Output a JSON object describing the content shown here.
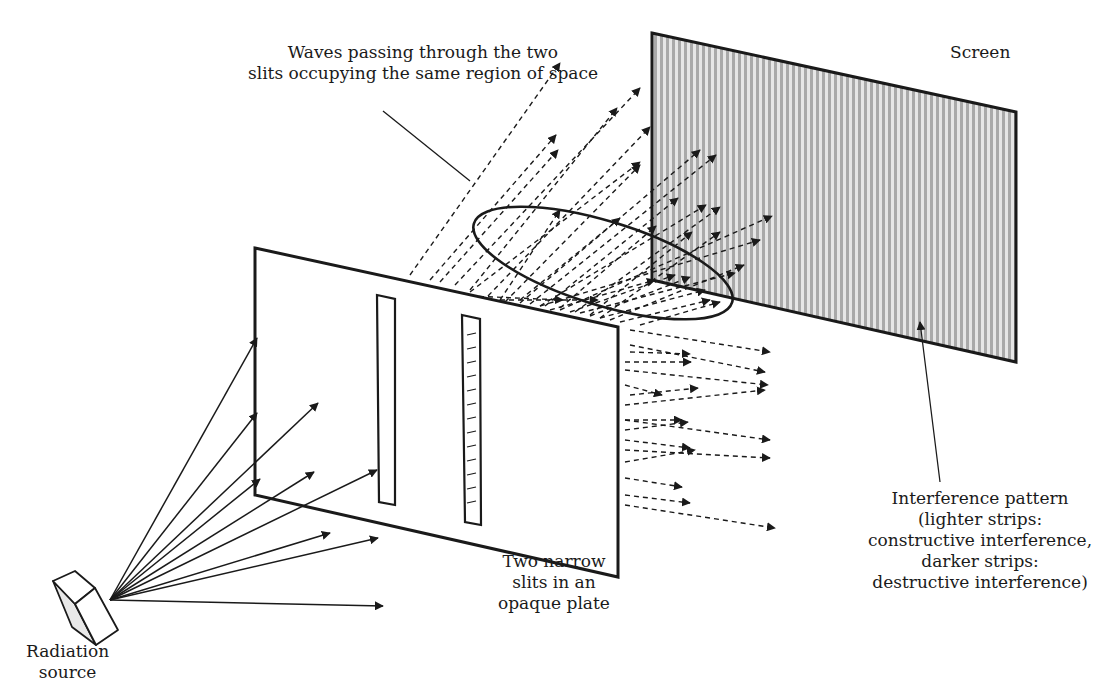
{
  "diagram": {
    "colors": {
      "ink": "#1a1a1a",
      "screen_fill": "#bdbdbd",
      "screen_stripe_light": "#e6e6e6",
      "plate_fill": "#ffffff",
      "source_side": "#e8e8e8"
    },
    "labels": {
      "waves": [
        "Waves passing through the two",
        "slits occupying the same region of space"
      ],
      "screen": [
        "Screen"
      ],
      "slits": [
        "Two narrow",
        "slits in an",
        "opaque plate"
      ],
      "source": [
        "Radiation",
        "source"
      ],
      "pattern": [
        "Interference pattern",
        "(lighter strips:",
        "constructive interference,",
        "darker strips:",
        "destructive interference)"
      ]
    },
    "components": {
      "plate": {
        "name": "opaque-plate",
        "points": [
          [
            255,
            248
          ],
          [
            618,
            327
          ],
          [
            618,
            577
          ],
          [
            255,
            495
          ]
        ]
      },
      "slit_left": {
        "name": "slit-left",
        "points": [
          [
            377,
            295
          ],
          [
            395,
            299
          ],
          [
            395,
            505
          ],
          [
            379,
            502
          ]
        ]
      },
      "slit_right": {
        "name": "slit-right",
        "points": [
          [
            462,
            315
          ],
          [
            480,
            319
          ],
          [
            481,
            525
          ],
          [
            465,
            522
          ]
        ]
      },
      "screen": {
        "name": "screen",
        "points": [
          [
            652,
            33
          ],
          [
            1016,
            112
          ],
          [
            1016,
            362
          ],
          [
            652,
            280
          ]
        ]
      },
      "ellipse": {
        "cx": 603,
        "cy": 263,
        "rx": 135,
        "ry": 42,
        "rotate": 17
      },
      "source_box": {
        "front": [
          [
            75,
            604
          ],
          [
            95,
            588
          ],
          [
            118,
            630
          ],
          [
            96,
            645
          ]
        ],
        "top": [
          [
            53,
            581
          ],
          [
            75,
            571
          ],
          [
            95,
            588
          ],
          [
            75,
            604
          ]
        ],
        "side": [
          [
            53,
            581
          ],
          [
            75,
            604
          ],
          [
            96,
            645
          ],
          [
            72,
            627
          ]
        ]
      }
    },
    "source_origin": [
      110,
      600
    ],
    "incident_rays": [
      [
        257,
        338
      ],
      [
        257,
        413
      ],
      [
        318,
        403
      ],
      [
        260,
        479
      ],
      [
        314,
        472
      ],
      [
        377,
        470
      ],
      [
        330,
        533
      ],
      [
        378,
        538
      ],
      [
        383,
        606
      ]
    ],
    "diffracted_rays": [
      [
        [
          410,
          275
        ],
        [
          560,
          63
        ]
      ],
      [
        [
          430,
          280
        ],
        [
          556,
          135
        ]
      ],
      [
        [
          440,
          282
        ],
        [
          558,
          150
        ]
      ],
      [
        [
          455,
          285
        ],
        [
          640,
          88
        ]
      ],
      [
        [
          470,
          290
        ],
        [
          617,
          108
        ]
      ],
      [
        [
          488,
          296
        ],
        [
          650,
          127
        ]
      ],
      [
        [
          505,
          302
        ],
        [
          640,
          165
        ]
      ],
      [
        [
          470,
          292
        ],
        [
          640,
          162
        ]
      ],
      [
        [
          520,
          303
        ],
        [
          700,
          150
        ]
      ],
      [
        [
          530,
          304
        ],
        [
          716,
          155
        ]
      ],
      [
        [
          540,
          306
        ],
        [
          706,
          205
        ]
      ],
      [
        [
          500,
          300
        ],
        [
          560,
          210
        ]
      ],
      [
        [
          520,
          300
        ],
        [
          620,
          218
        ]
      ],
      [
        [
          545,
          306
        ],
        [
          678,
          198
        ]
      ],
      [
        [
          560,
          308
        ],
        [
          656,
          226
        ]
      ],
      [
        [
          575,
          312
        ],
        [
          720,
          207
        ]
      ],
      [
        [
          590,
          315
        ],
        [
          692,
          232
        ]
      ],
      [
        [
          600,
          318
        ],
        [
          720,
          232
        ]
      ],
      [
        [
          610,
          320
        ],
        [
          744,
          265
        ]
      ],
      [
        [
          540,
          306
        ],
        [
          760,
          240
        ]
      ],
      [
        [
          560,
          310
        ],
        [
          772,
          216
        ]
      ],
      [
        [
          580,
          313
        ],
        [
          735,
          273
        ]
      ],
      [
        [
          600,
          318
        ],
        [
          705,
          290
        ]
      ],
      [
        [
          620,
          322
        ],
        [
          710,
          300
        ]
      ],
      [
        [
          640,
          325
        ],
        [
          720,
          302
        ]
      ],
      [
        [
          550,
          310
        ],
        [
          655,
          280
        ]
      ],
      [
        [
          570,
          312
        ],
        [
          675,
          275
        ]
      ],
      [
        [
          590,
          316
        ],
        [
          690,
          277
        ]
      ],
      [
        [
          470,
          296
        ],
        [
          563,
          300
        ]
      ],
      [
        [
          500,
          300
        ],
        [
          598,
          300
        ]
      ],
      [
        [
          630,
          330
        ],
        [
          770,
          352
        ]
      ],
      [
        [
          630,
          345
        ],
        [
          765,
          372
        ]
      ],
      [
        [
          630,
          352
        ],
        [
          690,
          354
        ]
      ],
      [
        [
          625,
          362
        ],
        [
          691,
          362
        ]
      ],
      [
        [
          625,
          370
        ],
        [
          768,
          385
        ]
      ],
      [
        [
          625,
          385
        ],
        [
          662,
          395
        ]
      ],
      [
        [
          630,
          395
        ],
        [
          698,
          388
        ]
      ],
      [
        [
          625,
          405
        ],
        [
          765,
          390
        ]
      ],
      [
        [
          625,
          420
        ],
        [
          682,
          420
        ]
      ],
      [
        [
          625,
          430
        ],
        [
          688,
          422
        ]
      ],
      [
        [
          625,
          420
        ],
        [
          770,
          440
        ]
      ],
      [
        [
          625,
          440
        ],
        [
          690,
          448
        ]
      ],
      [
        [
          625,
          450
        ],
        [
          770,
          458
        ]
      ],
      [
        [
          625,
          462
        ],
        [
          695,
          450
        ]
      ],
      [
        [
          625,
          478
        ],
        [
          682,
          487
        ]
      ],
      [
        [
          625,
          495
        ],
        [
          690,
          503
        ]
      ],
      [
        [
          625,
          505
        ],
        [
          775,
          528
        ]
      ]
    ],
    "annotation_lines": [
      {
        "name": "waves-leader",
        "from": [
          383,
          111
        ],
        "to": [
          470,
          181
        ]
      },
      {
        "name": "pattern-leader",
        "from": [
          940,
          482
        ],
        "to": [
          920,
          322
        ]
      }
    ]
  }
}
